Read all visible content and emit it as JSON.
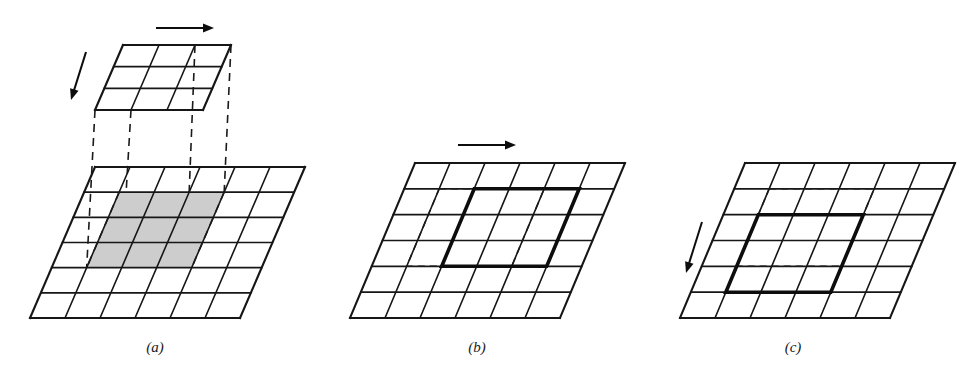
{
  "figure": {
    "kind": "line-drawing-diagram",
    "background_color": "#ffffff",
    "ink_color": "#161616",
    "shade_color": "#cdcdcd",
    "panels": [
      {
        "id": "a",
        "caption": "(a)",
        "caption_x": 155,
        "caption_y": 352,
        "description": "upper 3x3 tile above a 6x6 grid with shaded 3x3 region and dashed projection lines",
        "base_grid": {
          "cols": 6,
          "rows": 6,
          "top_left_x": 95,
          "top_y": 167,
          "bottom_left_x": 30,
          "bottom_y": 318,
          "width": 210,
          "shaded": {
            "col_start": 1,
            "col_end": 4,
            "row_start": 1,
            "row_end": 4
          }
        },
        "upper_grid": {
          "cols": 3,
          "rows": 3,
          "top_left_x": 123,
          "top_y": 45,
          "bottom_left_x": 95,
          "bottom_y": 110,
          "width": 108
        },
        "projection_lines": 4,
        "arrows": [
          {
            "name": "right-arrow",
            "x1": 156,
            "y1": 28,
            "x2": 214,
            "y2": 28
          },
          {
            "name": "down-left-arrow",
            "x1": 86,
            "y1": 52,
            "x2": 71,
            "y2": 100
          }
        ]
      },
      {
        "id": "b",
        "caption": "(b)",
        "caption_x": 477,
        "caption_y": 352,
        "description": "6x6 grid with bold 3x3 cell shifted one column right; dashed lines mark original position",
        "base_grid": {
          "cols": 6,
          "rows": 6,
          "top_left_x": 415,
          "top_y": 163,
          "bottom_left_x": 350,
          "bottom_y": 318,
          "width": 210,
          "bold": {
            "col_start": 2,
            "col_end": 5,
            "row_start": 1,
            "row_end": 4
          },
          "ghost": {
            "col_start": 1,
            "col_end": 4,
            "row_start": 1,
            "row_end": 4
          }
        },
        "arrows": [
          {
            "name": "right-arrow",
            "x1": 458,
            "y1": 145,
            "x2": 516,
            "y2": 145
          }
        ]
      },
      {
        "id": "c",
        "caption": "(c)",
        "caption_x": 793,
        "caption_y": 352,
        "description": "6x6 grid with bold 3x3 cell shifted one row down; dashed lines mark original position",
        "base_grid": {
          "cols": 6,
          "rows": 6,
          "top_left_x": 745,
          "top_y": 163,
          "bottom_left_x": 680,
          "bottom_y": 318,
          "width": 210,
          "bold": {
            "col_start": 1,
            "col_end": 4,
            "row_start": 2,
            "row_end": 5
          },
          "ghost": {
            "col_start": 1,
            "col_end": 4,
            "row_start": 1,
            "row_end": 4
          }
        },
        "arrows": [
          {
            "name": "down-left-arrow",
            "x1": 702,
            "y1": 222,
            "x2": 686,
            "y2": 273
          }
        ]
      }
    ]
  }
}
